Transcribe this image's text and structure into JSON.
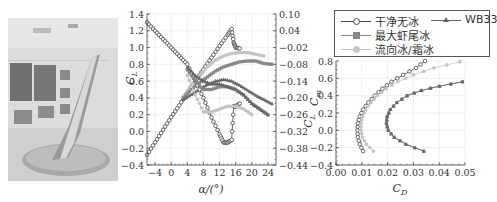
{
  "figure": {
    "photo": {
      "description": "Swept wing model mounted on turntable in icing wind tunnel test section",
      "alt": "wing-model-photo"
    },
    "legend": {
      "items": [
        {
          "label": "干净无冰",
          "marker": "circle",
          "color": "#444444"
        },
        {
          "label": "WB33",
          "marker": "triangle",
          "color": "#666666"
        },
        {
          "label": "最大虾尾冰",
          "marker": "square",
          "color": "#888888"
        },
        {
          "label": "流向冰/霜冰",
          "marker": "dot",
          "color": "#c4c4c4"
        }
      ]
    }
  },
  "chart_data": [
    {
      "type": "line",
      "title": "",
      "xlabel": "α/(°)",
      "ylabel": "C_L",
      "y2label": "C_m",
      "xlim": [
        -6,
        26
      ],
      "ylim": [
        -0.4,
        1.4
      ],
      "y2lim": [
        -0.44,
        0.1
      ],
      "xticks": [
        "-4",
        "0",
        "4",
        "8",
        "12",
        "16",
        "20",
        "24"
      ],
      "yticks": [
        "-0.4",
        "-0.2",
        "0.0",
        "0.2",
        "0.4",
        "0.6",
        "0.8",
        "1.0",
        "1.2",
        "1.4"
      ],
      "y2ticks": [
        "0.10",
        "0.04",
        "-0.02",
        "-0.08",
        "-0.14",
        "-0.20",
        "-0.26",
        "-0.32",
        "-0.38",
        "-0.44"
      ],
      "grid": true,
      "series": [
        {
          "name": "干净无冰 C_L",
          "color": "#444444",
          "marker": "circle",
          "x": [
            -6,
            -4,
            -2,
            0,
            2,
            4,
            6,
            8,
            10,
            12,
            14,
            15,
            15.5,
            16,
            17
          ],
          "y": [
            -0.28,
            -0.13,
            0.02,
            0.17,
            0.31,
            0.46,
            0.6,
            0.74,
            0.88,
            1.02,
            1.15,
            1.22,
            1.06,
            1.0,
            0.99
          ]
        },
        {
          "name": "流向冰/霜冰 C_L",
          "color": "#c4c4c4",
          "marker": "dot",
          "x": [
            3,
            5,
            7,
            9,
            11,
            13,
            15,
            17,
            19,
            21,
            23
          ],
          "y": [
            0.42,
            0.55,
            0.67,
            0.77,
            0.85,
            0.9,
            0.93,
            0.94,
            0.94,
            0.92,
            0.9
          ]
        },
        {
          "name": "最大虾尾冰 C_L",
          "color": "#888888",
          "marker": "square",
          "x": [
            3,
            5,
            7,
            9,
            11,
            13,
            15,
            17,
            19,
            21,
            23,
            25
          ],
          "y": [
            0.4,
            0.5,
            0.58,
            0.65,
            0.72,
            0.77,
            0.8,
            0.83,
            0.84,
            0.84,
            0.81,
            0.8
          ]
        },
        {
          "name": "WB33 C_L",
          "color": "#666666",
          "marker": "triangle",
          "x": [
            3,
            5,
            7,
            9,
            11,
            13,
            15,
            17,
            19,
            21,
            23,
            25
          ],
          "y": [
            0.38,
            0.44,
            0.5,
            0.56,
            0.6,
            0.62,
            0.6,
            0.55,
            0.49,
            0.43,
            0.38,
            0.33
          ]
        },
        {
          "name": "干净无冰 C_m",
          "color": "#444444",
          "marker": "circle",
          "x": [
            -6,
            -4,
            -2,
            0,
            2,
            4,
            6,
            8,
            10,
            12,
            13,
            14,
            15,
            15.5,
            16,
            17
          ],
          "y": [
            0.07,
            0.04,
            0.01,
            -0.02,
            -0.05,
            -0.08,
            -0.14,
            -0.2,
            -0.27,
            -0.33,
            -0.36,
            -0.36,
            -0.35,
            -0.23,
            -0.23,
            -0.22
          ]
        },
        {
          "name": "流向冰/霜冰 C_m",
          "color": "#c4c4c4",
          "marker": "dot",
          "x": [
            4,
            6,
            8,
            10,
            12,
            14,
            16,
            18,
            20
          ],
          "y": [
            -0.12,
            -0.19,
            -0.25,
            -0.25,
            -0.24,
            -0.23,
            -0.23,
            -0.24,
            -0.26
          ]
        },
        {
          "name": "最大虾尾冰 C_m",
          "color": "#888888",
          "marker": "square",
          "x": [
            4,
            6,
            8,
            10,
            12,
            14,
            16,
            18,
            20,
            22,
            24
          ],
          "y": [
            -0.1,
            -0.14,
            -0.17,
            -0.17,
            -0.16,
            -0.16,
            -0.17,
            -0.19,
            -0.22,
            -0.24,
            -0.26
          ]
        },
        {
          "name": "WB33 C_m",
          "color": "#666666",
          "marker": "triangle",
          "x": [
            4,
            6,
            8,
            10,
            12,
            14,
            16,
            18,
            20,
            22,
            24
          ],
          "y": [
            -0.09,
            -0.12,
            -0.14,
            -0.15,
            -0.15,
            -0.16,
            -0.17,
            -0.19,
            -0.22,
            -0.24,
            -0.26
          ]
        }
      ]
    },
    {
      "type": "line",
      "title": "",
      "xlabel": "C_D",
      "ylabel": "C_L",
      "xlim": [
        0.0,
        0.05
      ],
      "ylim": [
        -0.4,
        0.8
      ],
      "xticks": [
        "0.00",
        "0.01",
        "0.02",
        "0.03",
        "0.04",
        "0.05"
      ],
      "yticks": [
        "-0.4",
        "-0.2",
        "0.0",
        "0.2",
        "0.4",
        "0.6",
        "0.8"
      ],
      "grid": true,
      "series": [
        {
          "name": "干净无冰",
          "color": "#444444",
          "marker": "circle",
          "x": [
            0.0105,
            0.0092,
            0.0085,
            0.0083,
            0.0085,
            0.0092,
            0.0105,
            0.0125,
            0.015,
            0.018,
            0.0215,
            0.026,
            0.031,
            0.0345
          ],
          "y": [
            -0.24,
            -0.16,
            -0.08,
            0.0,
            0.08,
            0.16,
            0.24,
            0.32,
            0.4,
            0.48,
            0.56,
            0.64,
            0.72,
            0.8
          ]
        },
        {
          "name": "流向冰/霜冰",
          "color": "#c4c4c4",
          "marker": "dot",
          "x": [
            0.0145,
            0.0118,
            0.0103,
            0.0097,
            0.0097,
            0.0103,
            0.0115,
            0.0135,
            0.016,
            0.0195,
            0.024,
            0.03,
            0.038,
            0.048
          ],
          "y": [
            -0.24,
            -0.16,
            -0.08,
            0.0,
            0.08,
            0.16,
            0.24,
            0.32,
            0.4,
            0.48,
            0.56,
            0.64,
            0.72,
            0.79
          ]
        },
        {
          "name": "最大虾尾冰",
          "color": "#888888",
          "marker": "square",
          "x": [
            0.034,
            0.027,
            0.0225,
            0.0202,
            0.0195,
            0.0198,
            0.021,
            0.0235,
            0.0275,
            0.033,
            0.04,
            0.049
          ],
          "y": [
            -0.24,
            -0.16,
            -0.08,
            0.0,
            0.08,
            0.16,
            0.24,
            0.32,
            0.4,
            0.46,
            0.51,
            0.56
          ]
        },
        {
          "name": "WB33",
          "color": "#666666",
          "marker": "triangle",
          "x": [
            0.034,
            0.0272,
            0.0226,
            0.0203,
            0.0196,
            0.0199,
            0.0211,
            0.0236,
            0.0276,
            0.0332,
            0.0402,
            0.049
          ],
          "y": [
            -0.24,
            -0.16,
            -0.08,
            0.0,
            0.08,
            0.16,
            0.24,
            0.32,
            0.4,
            0.46,
            0.51,
            0.56
          ]
        }
      ]
    }
  ]
}
